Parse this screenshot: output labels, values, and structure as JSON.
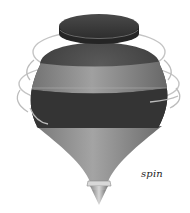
{
  "illustration": {
    "subject": "spinning-top",
    "caption": "spin"
  },
  "colors": {
    "background": "#ffffff",
    "cap": "#3a3a3a",
    "body_dark": "#3c3c3c",
    "band_light": "#8a8a8a",
    "cone": "#8e8e8e",
    "tip": "#b5b5b5",
    "motion_lines": "#b8b8b8"
  }
}
